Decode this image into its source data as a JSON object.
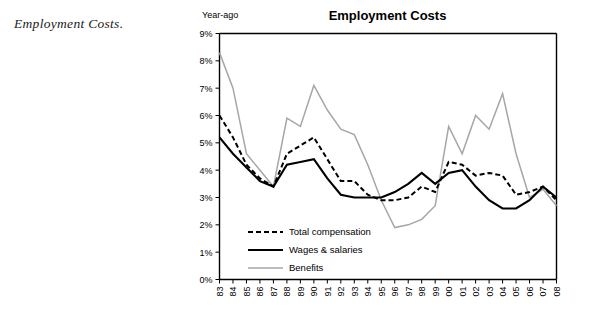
{
  "caption": "Employment Costs.",
  "chart": {
    "title": "Employment Costs",
    "y_axis_label": "Year-ago"
  },
  "legend": {
    "items": [
      {
        "label": "Total compensation",
        "style": "dashed",
        "color": "#000000"
      },
      {
        "label": "Wages & salaries",
        "style": "solid-thick",
        "color": "#000000"
      },
      {
        "label": "Benefits",
        "style": "solid-gray",
        "color": "#a6a6a6"
      }
    ]
  },
  "chart_data": {
    "type": "line",
    "title": "Employment Costs",
    "xlabel": "",
    "ylabel": "Year-ago",
    "ylim": [
      0,
      9
    ],
    "ytick_labels": [
      "0%",
      "1%",
      "2%",
      "3%",
      "4%",
      "5%",
      "6%",
      "7%",
      "8%",
      "9%"
    ],
    "ytick_values": [
      0,
      1,
      2,
      3,
      4,
      5,
      6,
      7,
      8,
      9
    ],
    "grid": false,
    "legend_position": "inside-lower-left",
    "categories": [
      "83",
      "84",
      "85",
      "86",
      "87",
      "88",
      "89",
      "90",
      "91",
      "92",
      "93",
      "94",
      "95",
      "96",
      "97",
      "98",
      "99",
      "00",
      "01",
      "02",
      "03",
      "04",
      "05",
      "06",
      "07",
      "08"
    ],
    "series": [
      {
        "name": "Total compensation",
        "color": "#000000",
        "style": "dashed",
        "values": [
          6.0,
          5.2,
          4.2,
          3.7,
          3.4,
          4.6,
          4.9,
          5.2,
          4.4,
          3.6,
          3.6,
          3.1,
          2.9,
          2.9,
          3.0,
          3.4,
          3.2,
          4.3,
          4.2,
          3.8,
          3.9,
          3.8,
          3.1,
          3.2,
          3.4,
          2.9
        ]
      },
      {
        "name": "Wages & salaries",
        "color": "#000000",
        "style": "solid-thick",
        "values": [
          5.2,
          4.6,
          4.1,
          3.6,
          3.4,
          4.2,
          4.3,
          4.4,
          3.7,
          3.1,
          3.0,
          3.0,
          3.0,
          3.2,
          3.5,
          3.9,
          3.5,
          3.9,
          4.0,
          3.4,
          2.9,
          2.6,
          2.6,
          2.9,
          3.4,
          3.0
        ]
      },
      {
        "name": "Benefits",
        "color": "#a6a6a6",
        "style": "solid",
        "values": [
          8.3,
          7.0,
          4.6,
          4.0,
          3.4,
          5.9,
          5.6,
          7.1,
          6.2,
          5.5,
          5.3,
          4.2,
          2.9,
          1.9,
          2.0,
          2.2,
          2.7,
          5.6,
          4.6,
          6.0,
          5.5,
          6.8,
          4.6,
          3.0,
          3.3,
          2.7
        ]
      }
    ]
  }
}
